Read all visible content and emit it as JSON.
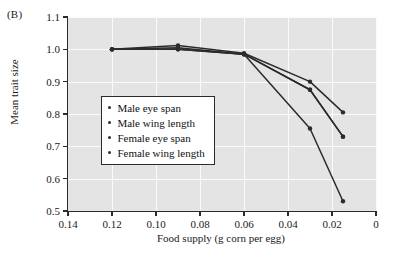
{
  "panel": {
    "label": "(B)"
  },
  "chart_data": {
    "type": "line",
    "title": "",
    "xlabel": "Food supply (g corn per egg)",
    "ylabel": "Mean trait size",
    "xlim": [
      0.14,
      0.0
    ],
    "ylim": [
      0.5,
      1.1
    ],
    "x_reversed": true,
    "grid": true,
    "legend_position": "inside-left",
    "xticks": [
      "0.14",
      "0.12",
      "0.10",
      "0.08",
      "0.06",
      "0.04",
      "0.02",
      "0"
    ],
    "xtick_values": [
      0.14,
      0.12,
      0.1,
      0.08,
      0.06,
      0.04,
      0.02,
      0.0
    ],
    "yticks": [
      "0.5",
      "0.6",
      "0.7",
      "0.8",
      "0.9",
      "1.0",
      "1.1"
    ],
    "ytick_values": [
      0.5,
      0.6,
      0.7,
      0.8,
      0.9,
      1.0,
      1.1
    ],
    "x": [
      0.12,
      0.09,
      0.06,
      0.03,
      0.015
    ],
    "series": [
      {
        "name": "Male eye span",
        "marker": "circle",
        "color": "#2b2b2b",
        "values": [
          1.0,
          1.005,
          0.985,
          0.755,
          0.53
        ]
      },
      {
        "name": "Male wing length",
        "marker": "circle",
        "color": "#2b2b2b",
        "values": [
          1.0,
          1.0,
          0.985,
          0.875,
          0.73
        ]
      },
      {
        "name": "Female eye span",
        "marker": "circle",
        "color": "#2b2b2b",
        "values": [
          1.0,
          1.012,
          0.988,
          0.9,
          0.805
        ]
      },
      {
        "name": "Female wing length",
        "marker": "circle",
        "color": "#2b2b2b",
        "values": [
          1.0,
          1.0,
          0.985,
          0.875,
          0.73
        ]
      }
    ]
  },
  "legend": {
    "items": [
      {
        "label": "Male eye span"
      },
      {
        "label": "Male wing length"
      },
      {
        "label": "Female eye span"
      },
      {
        "label": "Female wing length"
      }
    ]
  },
  "colors": {
    "plot_background": "#e4e4e4",
    "gridline": "#fbfbfb",
    "axis": "#2b2b2b",
    "series": "#2b2b2b",
    "page_background": "#ffffff"
  }
}
